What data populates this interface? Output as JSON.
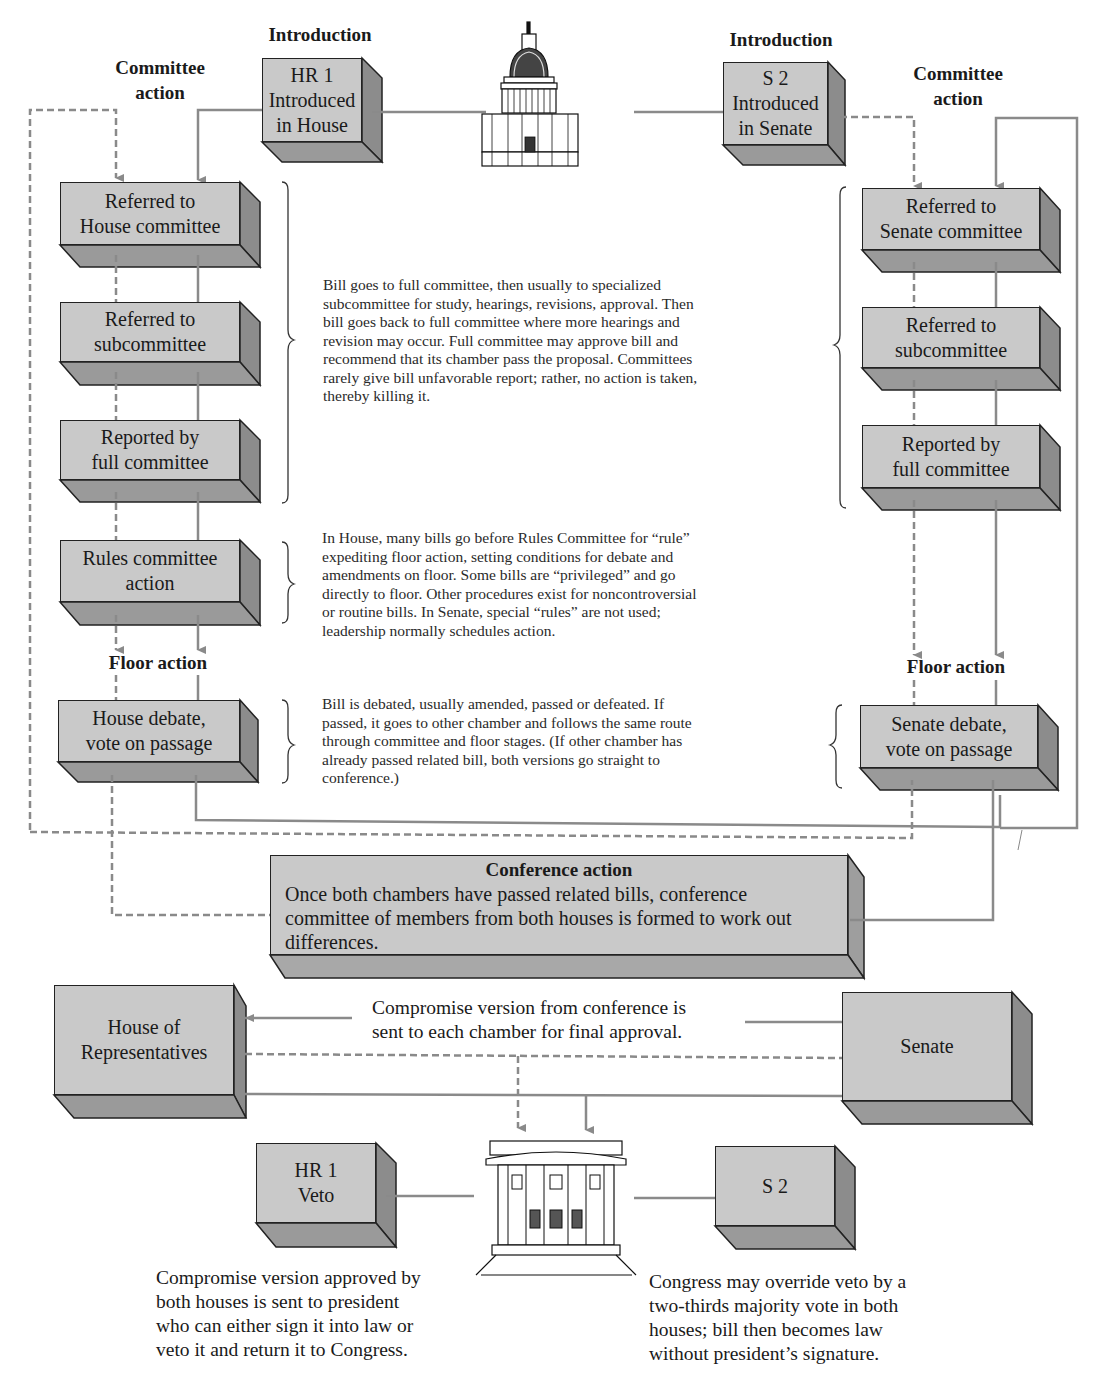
{
  "diagram": {
    "colors": {
      "box_face": "#c9c9c9",
      "box_side": "#8c8c8c",
      "box_bottom": "#999999",
      "connector": "#8a8a8a",
      "outline": "#222222",
      "text": "#1a1a1a"
    },
    "stage_labels": {
      "introduction_left": "Introduction",
      "introduction_right": "Introduction",
      "committee_left": "Committee\naction",
      "committee_right": "Committee\naction",
      "floor_left": "Floor action",
      "floor_right": "Floor action"
    },
    "house_track": {
      "intro": "HR 1\nIntroduced\nin House",
      "referred_committee": "Referred to\nHouse committee",
      "referred_sub": "Referred to\nsubcommittee",
      "reported": "Reported by\nfull committee",
      "rules": "Rules committee\naction",
      "debate": "House debate,\nvote on passage"
    },
    "senate_track": {
      "intro": "S 2\nIntroduced\nin Senate",
      "referred_committee": "Referred to\nSenate committee",
      "referred_sub": "Referred to\nsubcommittee",
      "reported": "Reported by\nfull committee",
      "debate": "Senate debate,\nvote on passage"
    },
    "notes": {
      "committee": "Bill goes to full committee, then usually to specialized\nsubcommittee for study, hearings, revisions, approval. Then\nbill goes back to full committee where more hearings and\nrevision may occur. Full committee may approve bill and\nrecommend that its chamber pass the proposal. Committees\nrarely give bill unfavorable report; rather, no action is taken,\nthereby killing it.",
      "rules": "In House, many bills go before Rules Committee for “rule”\nexpediting floor action, setting conditions for debate and\namendments on floor. Some bills are “privileged” and go\ndirectly to floor. Other procedures exist for noncontroversial\nor routine bills. In Senate, special “rules” are not used;\nleadership normally schedules action.",
      "floor": "Bill is debated, usually amended, passed or defeated. If\npassed, it goes to other chamber and follows the same route\nthrough committee and floor stages. (If other chamber has\nalready passed related bill, both versions go straight to\nconference.)"
    },
    "conference": {
      "title": "Conference action",
      "body": "Once both chambers have passed related bills, conference committee of members from both houses is formed to work out differences."
    },
    "final": {
      "house": "House of\nRepresentatives",
      "senate": "Senate",
      "compromise_note": "Compromise version from conference is\nsent to each chamber for final approval."
    },
    "president": {
      "hr_veto": "HR 1\nVeto",
      "s2": "S 2",
      "left_note": "Compromise version approved by\nboth houses is sent to president\nwho can either sign it into law or\nveto it and return it to Congress.",
      "right_note": "Congress may override veto by a\ntwo-thirds majority vote in both\nhouses; bill then becomes law\nwithout president’s signature."
    },
    "icons": {
      "capitol": "capitol-building-icon",
      "white_house": "white-house-icon"
    }
  }
}
